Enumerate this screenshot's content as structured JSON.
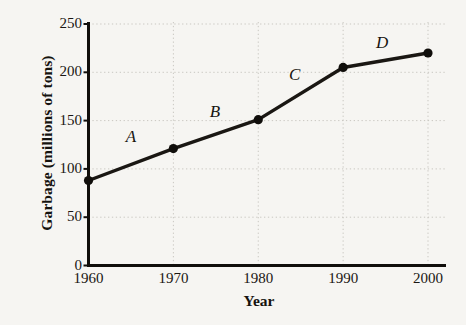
{
  "chart_data": {
    "type": "line",
    "title": "",
    "xlabel": "Year",
    "ylabel": "Garbage (millions of tons)",
    "x": [
      1960,
      1970,
      1980,
      1990,
      2000
    ],
    "categories": [
      "1960",
      "1970",
      "1980",
      "1990",
      "2000"
    ],
    "values": [
      88,
      121,
      151,
      205,
      220
    ],
    "series": [
      {
        "name": "Garbage",
        "values": [
          88,
          121,
          151,
          205,
          220
        ]
      }
    ],
    "xlim": [
      1960,
      2000
    ],
    "ylim": [
      0,
      250
    ],
    "yticks": [
      0,
      50,
      100,
      150,
      200,
      250
    ],
    "ytick_labels": [
      "0",
      "50",
      "100",
      "150",
      "200",
      "250"
    ],
    "xticks": [
      1960,
      1970,
      1980,
      1990,
      2000
    ],
    "xtick_labels": [
      "1960",
      "1970",
      "1980",
      "1990",
      "2000"
    ],
    "grid": true,
    "grid_style": "dotted",
    "legend": false,
    "legend_position": "none",
    "marker": "filled-circle",
    "annotations": [
      {
        "label": "A",
        "segment": "1960-1970",
        "x": 1965,
        "y": 133
      },
      {
        "label": "B",
        "segment": "1970-1980",
        "x": 1974.9,
        "y": 159
      },
      {
        "label": "C",
        "segment": "1980-1990",
        "x": 1984.3,
        "y": 197
      },
      {
        "label": "D",
        "segment": "1990-2000",
        "x": 1994.6,
        "y": 230
      }
    ],
    "colors": {
      "background": "#f6f5f2",
      "line": "#1a1713",
      "marker": "#100e0b",
      "axis": "#100e0b",
      "grid": "#c9c7c1",
      "text": "#17140f"
    }
  }
}
